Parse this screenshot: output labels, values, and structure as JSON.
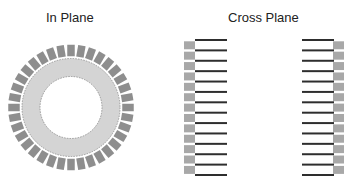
{
  "panels": {
    "in_plane": {
      "title": "In Plane",
      "block_count": 36
    },
    "cross_plane": {
      "title": "Cross Plane",
      "line_count": 14,
      "block_count": 13
    }
  },
  "colors": {
    "ring_fill": "#d4d4d4",
    "ring_edge": "#8a8a8a",
    "ring_block": "#8e8e8e",
    "cross_block": "#a8a8a8",
    "line": "#2e2e2e",
    "text": "#222222"
  }
}
